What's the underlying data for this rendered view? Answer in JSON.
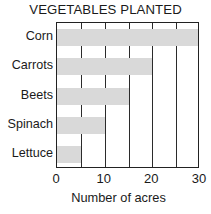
{
  "chart_data": {
    "type": "bar",
    "orientation": "horizontal",
    "title": "VEGETABLES PLANTED",
    "xlabel": "Number of acres",
    "ylabel": "",
    "categories": [
      "Corn",
      "Carrots",
      "Beets",
      "Spinach",
      "Lettuce"
    ],
    "values": [
      30,
      20,
      15,
      10,
      5
    ],
    "xlim": [
      0,
      30
    ],
    "xticks": [
      0,
      10,
      20,
      30
    ],
    "xtick_labels": [
      "0",
      "10",
      "20",
      "30"
    ],
    "gridlines": [
      5,
      10,
      15,
      20,
      25
    ],
    "grid": true,
    "legend": null,
    "bar_color": "#d9d9d9",
    "axis_color": "#222222",
    "text_color": "#1a1a1a",
    "background": "#ffffff"
  }
}
